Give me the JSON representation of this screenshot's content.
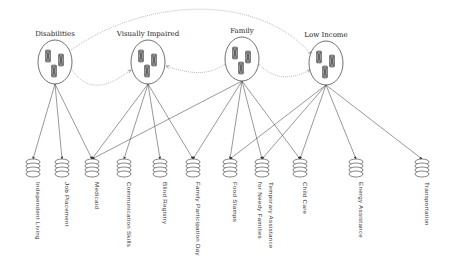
{
  "diagram": {
    "type": "bipartite-network",
    "groups": [
      {
        "id": "disabilities",
        "label": "Disabilities",
        "cx": 55,
        "cy": 62
      },
      {
        "id": "visually_impaired",
        "label": "Visually Impaired",
        "cx": 148,
        "cy": 62
      },
      {
        "id": "family",
        "label": "Family",
        "cx": 242,
        "cy": 59
      },
      {
        "id": "low_income",
        "label": "Low Income",
        "cx": 326,
        "cy": 63
      }
    ],
    "services": [
      {
        "id": "independent_living",
        "label": "Independent Living",
        "x": 33
      },
      {
        "id": "job_placement",
        "label": "Job Placement",
        "x": 62
      },
      {
        "id": "medicaid",
        "label": "Medicaid",
        "x": 92
      },
      {
        "id": "communication_skills",
        "label": "Communication Skills",
        "x": 124
      },
      {
        "id": "blind_registry",
        "label": "Blind Registry",
        "x": 160
      },
      {
        "id": "family_participation_day",
        "label": "Family Participation Day",
        "x": 193
      },
      {
        "id": "food_stamps",
        "label": "Food Stamps",
        "x": 230
      },
      {
        "id": "temporary_assistance",
        "label": "Temporary Assistance",
        "label2": "for Needy Families",
        "x": 262
      },
      {
        "id": "child_care",
        "label": "Child Care",
        "x": 300
      },
      {
        "id": "energy_assistance",
        "label": "Energy Assistance",
        "x": 356
      },
      {
        "id": "transportation",
        "label": "Transportation",
        "x": 422
      }
    ],
    "edges": [
      [
        "disabilities",
        "independent_living"
      ],
      [
        "disabilities",
        "job_placement"
      ],
      [
        "disabilities",
        "medicaid"
      ],
      [
        "visually_impaired",
        "medicaid"
      ],
      [
        "visually_impaired",
        "communication_skills"
      ],
      [
        "visually_impaired",
        "blind_registry"
      ],
      [
        "visually_impaired",
        "family_participation_day"
      ],
      [
        "family",
        "medicaid"
      ],
      [
        "family",
        "family_participation_day"
      ],
      [
        "family",
        "food_stamps"
      ],
      [
        "family",
        "temporary_assistance"
      ],
      [
        "family",
        "child_care"
      ],
      [
        "low_income",
        "food_stamps"
      ],
      [
        "low_income",
        "temporary_assistance"
      ],
      [
        "low_income",
        "child_care"
      ],
      [
        "low_income",
        "energy_assistance"
      ],
      [
        "low_income",
        "transportation"
      ]
    ],
    "group_links": [
      {
        "from": "disabilities",
        "to": "visually_impaired",
        "style": "dotted"
      },
      {
        "from": "disabilities",
        "to": "low_income",
        "style": "dotted"
      },
      {
        "from": "family",
        "to": "visually_impaired",
        "style": "dotted"
      },
      {
        "from": "family",
        "to": "low_income",
        "style": "dotted"
      }
    ]
  }
}
